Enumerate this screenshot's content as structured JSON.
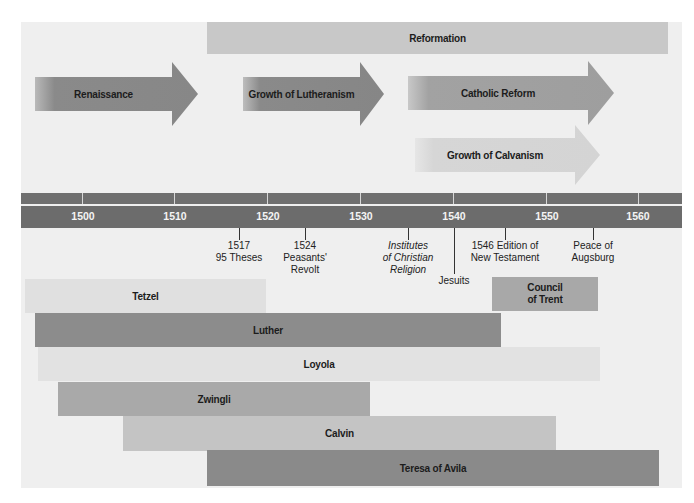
{
  "diagram": {
    "type": "timeline",
    "colors": {
      "background": "#efefef",
      "timeline_band": "#6c6c6c",
      "reformation": "#c8c8c8",
      "renaissance": "#8a8a8a",
      "lutheranism": "#8a8a8a",
      "catholic_reform": "#a0a0a0",
      "calvanism": "#d6d6d6"
    },
    "movements": {
      "reformation": "Reformation",
      "renaissance": "Renaissance",
      "lutheranism": "Growth of Lutheranism",
      "catholic_reform": "Catholic Reform",
      "calvanism": "Growth of Calvanism"
    },
    "years": [
      "1500",
      "1510",
      "1520",
      "1530",
      "1540",
      "1550",
      "1560"
    ],
    "events": [
      {
        "line1": "1517",
        "line2": "95 Theses",
        "line3": ""
      },
      {
        "line1": "1524",
        "line2": "Peasants'",
        "line3": "Revolt"
      },
      {
        "line1": "Institutes",
        "line2": "of Christian",
        "line3": "Religion"
      },
      {
        "line1": "Jesuits",
        "line2": "",
        "line3": ""
      },
      {
        "line1": "1546 Edition of",
        "line2": "New Testament",
        "line3": ""
      },
      {
        "line1": "Peace of",
        "line2": "Augsburg",
        "line3": ""
      }
    ],
    "people": [
      {
        "name": "Tetzel",
        "color": "#e0e0e0"
      },
      {
        "name": "Council",
        "name2": "of Trent",
        "color": "#a8a8a8"
      },
      {
        "name": "Luther",
        "color": "#8c8c8c"
      },
      {
        "name": "Loyola",
        "color": "#e2e2e2"
      },
      {
        "name": "Zwingli",
        "color": "#a9a9a9"
      },
      {
        "name": "Calvin",
        "color": "#c4c4c4"
      },
      {
        "name": "Teresa of Avila",
        "color": "#8a8a8a"
      }
    ]
  }
}
